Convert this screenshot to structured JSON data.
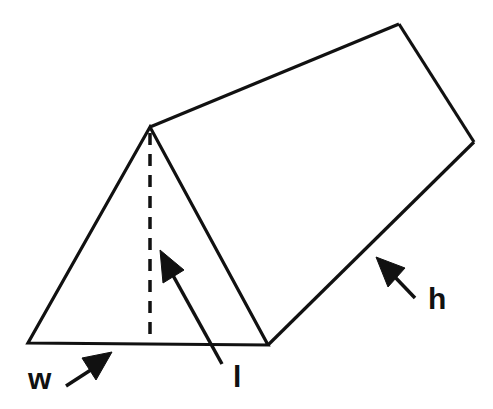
{
  "diagram": {
    "labels": {
      "w": "w",
      "l": "l",
      "h": "h"
    },
    "colors": {
      "stroke": "#111111",
      "background": "#ffffff"
    }
  }
}
